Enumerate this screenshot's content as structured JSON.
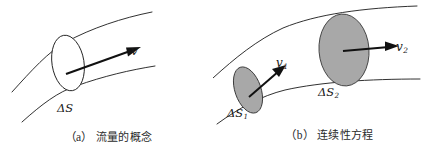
{
  "figure": {
    "background_color": "#ffffff",
    "stroke_color": "#1a1a1a",
    "ellipse_fill_gray": "#a8a8a8",
    "ellipse_fill_white": "#ffffff"
  },
  "panel_a": {
    "caption_index": "（a）",
    "caption_text": "流量的概念",
    "labels": {
      "area": "ΔS",
      "velocity": "v"
    },
    "cross_section_fill": "white"
  },
  "panel_b": {
    "caption_index": "（b）",
    "caption_text": "连续性方程",
    "labels": {
      "area_1": "ΔS",
      "area_1_sub": "1",
      "area_2": "ΔS",
      "area_2_sub": "2",
      "velocity_1": "v",
      "velocity_1_sub": "1",
      "velocity_2": "v",
      "velocity_2_sub": "2"
    },
    "cross_section_fill": "gray"
  }
}
